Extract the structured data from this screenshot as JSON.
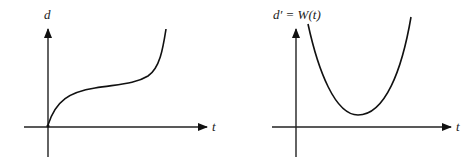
{
  "figure": {
    "left_graph": {
      "y_label": "d",
      "x_label": "t",
      "curve_path": "M48,125 C56,100 70,92 95,88 C120,84 135,84 148,76 C160,68 163,48 166,29"
    },
    "right_graph": {
      "y_label": "d′ = W(t)",
      "x_label": "t",
      "curve_path": "M308,24 C318,70 335,115 358,115 C385,115 402,70 411,17"
    },
    "colors": {
      "ink": "#111111",
      "background": "#ffffff"
    }
  }
}
